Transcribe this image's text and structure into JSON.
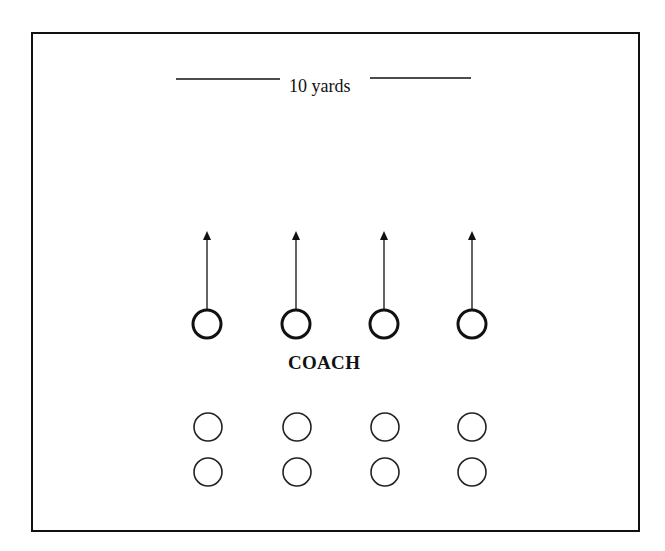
{
  "diagram": {
    "distance_label": "10 yards",
    "coach_label": "COACH",
    "colors": {
      "stroke": "#111111",
      "background": "#ffffff"
    },
    "runners": [
      {
        "id": 1,
        "x": 207,
        "y": 324
      },
      {
        "id": 2,
        "x": 296,
        "y": 324
      },
      {
        "id": 3,
        "x": 384,
        "y": 324
      },
      {
        "id": 4,
        "x": 472,
        "y": 324
      }
    ],
    "waiting_rows": [
      {
        "row": 1,
        "y": 427,
        "xs": [
          208,
          297,
          385,
          472
        ]
      },
      {
        "row": 2,
        "y": 472,
        "xs": [
          208,
          297,
          385,
          472
        ]
      }
    ]
  }
}
